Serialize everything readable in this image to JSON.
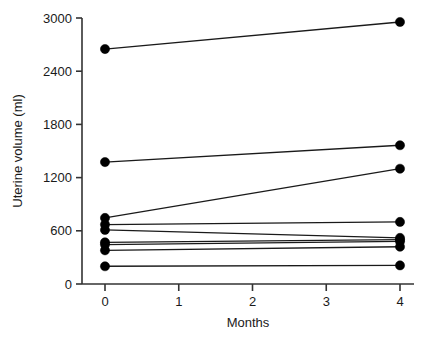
{
  "chart_data": {
    "type": "line",
    "title": "",
    "subtitle": "",
    "xlabel": "Months",
    "ylabel": "Uterine volume (ml)",
    "xlim": [
      0,
      4
    ],
    "ylim": [
      0,
      3000
    ],
    "x_ticks": [
      0,
      1,
      2,
      3,
      4
    ],
    "x_tick_labels": [
      "0",
      "1",
      "2",
      "3",
      "4"
    ],
    "y_ticks": [
      0,
      600,
      1200,
      1800,
      2400,
      3000
    ],
    "y_tick_labels": [
      "0",
      "600",
      "1200",
      "1800",
      "2400",
      "3000"
    ],
    "grid": false,
    "legend": null,
    "legend_position": "none",
    "marker": "filled-circle",
    "marker_color": "#000000",
    "line_color": "#1a1a1a",
    "x": [
      0,
      4
    ],
    "series": [
      {
        "name": "subject-1",
        "values": [
          2650,
          2955
        ]
      },
      {
        "name": "subject-2",
        "values": [
          1375,
          1565
        ]
      },
      {
        "name": "subject-3",
        "values": [
          745,
          1300
        ]
      },
      {
        "name": "subject-4",
        "values": [
          670,
          700
        ]
      },
      {
        "name": "subject-5",
        "values": [
          610,
          520
        ]
      },
      {
        "name": "subject-6",
        "values": [
          470,
          500
        ]
      },
      {
        "name": "subject-7",
        "values": [
          445,
          480
        ]
      },
      {
        "name": "subject-8",
        "values": [
          380,
          420
        ]
      },
      {
        "name": "subject-9",
        "values": [
          200,
          210
        ]
      }
    ],
    "annotations": []
  },
  "axes": {
    "x_title": "Months",
    "y_title": "Uterine volume (ml)",
    "y_labels": [
      "3000",
      "2400",
      "1800",
      "1200",
      "600",
      "0"
    ],
    "x_labels": [
      "0",
      "1",
      "2",
      "3",
      "4"
    ]
  },
  "colors": {
    "background": "#ffffff",
    "ink": "#1a1a1a",
    "marker": "#000000",
    "axis": "#333333"
  }
}
